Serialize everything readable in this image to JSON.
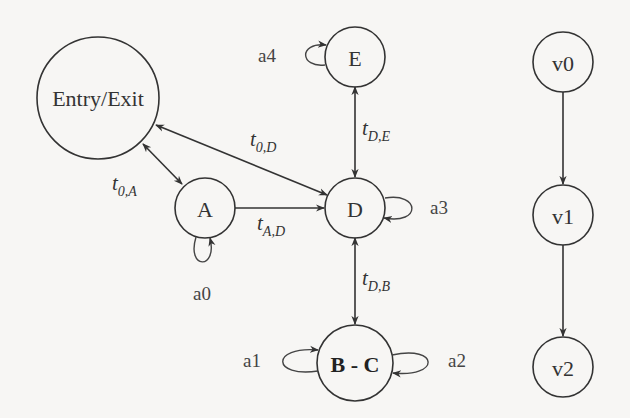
{
  "diagram": {
    "nodes": {
      "entry_exit": "Entry/Exit",
      "a": "A",
      "d": "D",
      "e": "E",
      "bc": "B - C",
      "v0": "v0",
      "v1": "v1",
      "v2": "v2"
    },
    "edges": {
      "t0a": {
        "base": "t",
        "sub": "0,A"
      },
      "t0d": {
        "base": "t",
        "sub": "0,D"
      },
      "tad": {
        "base": "t",
        "sub": "A,D"
      },
      "tde": {
        "base": "t",
        "sub": "D,E"
      },
      "tdb": {
        "base": "t",
        "sub": "D,B"
      }
    },
    "self_loops": {
      "a0": "a0",
      "a1": "a1",
      "a2": "a2",
      "a3": "a3",
      "a4": "a4"
    },
    "colors": {
      "stroke": "#333333",
      "background": "#f7f6f4"
    }
  }
}
